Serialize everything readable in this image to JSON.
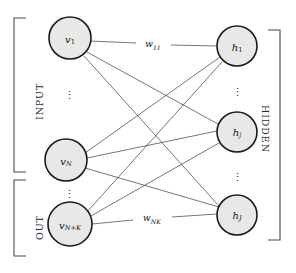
{
  "figure": {
    "type": "diagram",
    "background_color": "#ffffff",
    "node_fill": "#e8e8e8",
    "node_stroke": "#1a1a1a",
    "edge_color": "#3a3a3a",
    "bracket_color": "#4a4a4a"
  },
  "groups": {
    "input": {
      "label": "INPUT",
      "bracket_top": 18,
      "bracket_bottom": 172
    },
    "out": {
      "label": "OUT",
      "bracket_top": 180,
      "bracket_bottom": 256
    },
    "hidden": {
      "label": "HIDDEN",
      "bracket_top": 30,
      "bracket_bottom": 240
    }
  },
  "visible_nodes": [
    {
      "id": "v1",
      "base": "v",
      "sub": "1",
      "sub_style": "upright",
      "cx": 70,
      "cy": 38,
      "r": 21
    },
    {
      "id": "vN",
      "base": "v",
      "sub": "N",
      "sub_style": "italic",
      "cx": 66,
      "cy": 160,
      "r": 21
    },
    {
      "id": "vNK",
      "base": "v",
      "sub": "N+K",
      "sub_style": "italic",
      "cx": 70,
      "cy": 224,
      "r": 22
    }
  ],
  "hidden_nodes": [
    {
      "id": "h1",
      "base": "h",
      "sub": "1",
      "sub_style": "upright",
      "cx": 237,
      "cy": 46,
      "r": 20
    },
    {
      "id": "hj",
      "base": "h",
      "sub": "j",
      "sub_style": "italic",
      "cx": 237,
      "cy": 132,
      "r": 20
    },
    {
      "id": "hJ",
      "base": "h",
      "sub": "J",
      "sub_style": "italic",
      "cx": 237,
      "cy": 215,
      "r": 20
    }
  ],
  "ellipses": [
    {
      "id": "visible-ellipsis-upper",
      "cx": 69,
      "cy": 95,
      "glyph": "⋮"
    },
    {
      "id": "visible-ellipsis-lower",
      "cx": 69,
      "cy": 194,
      "glyph": "⋮"
    },
    {
      "id": "hidden-ellipsis-upper",
      "cx": 237,
      "cy": 92,
      "glyph": "⋮"
    },
    {
      "id": "hidden-ellipsis-lower",
      "cx": 237,
      "cy": 177,
      "glyph": "⋮"
    }
  ],
  "weights": [
    {
      "id": "w11",
      "base": "w",
      "sub": "11",
      "x": 153,
      "y": 44,
      "from": "v1",
      "to": "h1"
    },
    {
      "id": "wNK",
      "base": "w",
      "sub": "NK",
      "x": 152,
      "y": 218,
      "from": "vNK",
      "to": "hJ"
    }
  ],
  "edges": [
    {
      "from": "v1",
      "to": "h1"
    },
    {
      "from": "v1",
      "to": "hj"
    },
    {
      "from": "v1",
      "to": "hJ"
    },
    {
      "from": "vN",
      "to": "h1"
    },
    {
      "from": "vN",
      "to": "hj"
    },
    {
      "from": "vN",
      "to": "hJ"
    },
    {
      "from": "vNK",
      "to": "h1"
    },
    {
      "from": "vNK",
      "to": "hj"
    },
    {
      "from": "vNK",
      "to": "hJ"
    }
  ]
}
